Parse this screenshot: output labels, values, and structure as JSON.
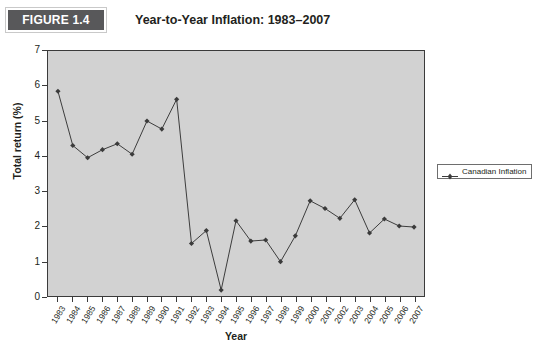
{
  "figure": {
    "badge_label": "FIGURE 1.4",
    "title": "Year-to-Year Inflation: 1983–2007"
  },
  "legend": {
    "position": "right",
    "entries": [
      {
        "label": "Canadian Inflation",
        "color": "#3b3b3b",
        "marker": "diamond"
      }
    ]
  },
  "colors": {
    "badge_background": "#58585a",
    "badge_text": "#ffffff",
    "plot_background": "#d2d2d2",
    "axis": "#3b3b3b",
    "series": "#3b3b3b",
    "text": "#231f20"
  },
  "chart_data": {
    "type": "line",
    "title": "Year-to-Year Inflation: 1983–2007",
    "xlabel": "Year",
    "ylabel": "Total return (%)",
    "ylim": [
      0,
      7
    ],
    "yticks": [
      0,
      1,
      2,
      3,
      4,
      5,
      6,
      7
    ],
    "grid": false,
    "legend_position": "right",
    "categories": [
      "1983",
      "1984",
      "1985",
      "1986",
      "1987",
      "1988",
      "1989",
      "1990",
      "1991",
      "1992",
      "1993",
      "1994",
      "1995",
      "1996",
      "1997",
      "1998",
      "1999",
      "2000",
      "2001",
      "2002",
      "2003",
      "2004",
      "2005",
      "2006",
      "2007"
    ],
    "series": [
      {
        "name": "Canadian Inflation",
        "color": "#3b3b3b",
        "marker": "diamond",
        "values": [
          5.85,
          4.3,
          3.95,
          4.18,
          4.35,
          4.05,
          5.0,
          4.77,
          5.62,
          1.5,
          1.87,
          0.17,
          2.15,
          1.57,
          1.6,
          0.98,
          1.72,
          2.72,
          2.5,
          2.22,
          2.75,
          1.8,
          2.2,
          2.0,
          1.97
        ]
      }
    ]
  }
}
